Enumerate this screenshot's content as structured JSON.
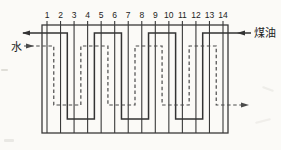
{
  "diagram": {
    "kind": "plate-heat-exchanger-flow-schematic",
    "plate_numbers": [
      "1",
      "2",
      "3",
      "4",
      "5",
      "6",
      "7",
      "8",
      "9",
      "10",
      "11",
      "12",
      "13",
      "14"
    ],
    "streams": {
      "kerosene": {
        "label": "煤油",
        "line_style": "solid",
        "inlet": "top-right",
        "outlet": "top-left",
        "channels": [
          12,
          10,
          8,
          6,
          4,
          2
        ]
      },
      "water": {
        "label": "水",
        "line_style": "dashed",
        "inlet": "top-left",
        "outlet": "bottom-right",
        "channels": [
          1,
          3,
          5,
          7,
          9,
          11,
          13
        ]
      }
    },
    "colors": {
      "line": "#3a3a3a",
      "background": "#fbfaf7"
    }
  }
}
